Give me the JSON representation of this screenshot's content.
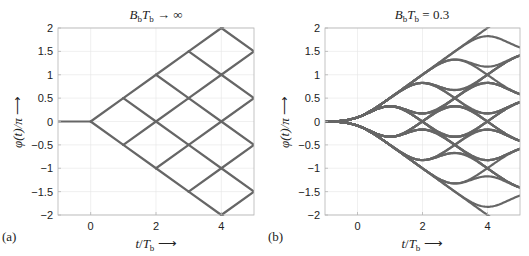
{
  "chart_data": [
    {
      "type": "line",
      "panel_label": "(a)",
      "title": "BbTb → ∞",
      "title_parts": {
        "B": "B",
        "b1": "b",
        "T": "T",
        "b2": "b",
        "rest": " → ∞"
      },
      "xlabel": "t/Tb ⟶",
      "ylabel": "φ(t)/π ⟶",
      "xlim": [
        -1,
        5
      ],
      "ylim": [
        -2,
        2
      ],
      "xticks": [
        0,
        2,
        4
      ],
      "yticks": [
        -2,
        -1.5,
        -1,
        -0.5,
        0,
        0.5,
        1,
        1.5,
        2
      ],
      "ytick_labels": [
        "−2",
        "−1.5",
        "−1",
        "−0.5",
        "0",
        "0.5",
        "1",
        "1.5",
        "2"
      ],
      "grid": true,
      "description": "Ideal MSK phase trellis: phase 0 for t<0, then changes by ±0.5 (in units of π) linearly per bit interval",
      "lines_start": {
        "x": [
          -1,
          0
        ],
        "y": [
          0,
          0
        ]
      },
      "trellis_step": 0.5,
      "bits": 5,
      "color": "#666666"
    },
    {
      "type": "line",
      "panel_label": "(b)",
      "title": "BbTb = 0.3",
      "title_parts": {
        "B": "B",
        "b1": "b",
        "T": "T",
        "b2": "b",
        "rest": " = 0.3"
      },
      "BT": 0.3,
      "xlabel": "t/Tb ⟶",
      "ylabel": "φ(t)/π ⟶",
      "xlim": [
        -1,
        5
      ],
      "ylim": [
        -2,
        2
      ],
      "xticks": [
        0,
        2,
        4
      ],
      "yticks": [
        -2,
        -1.5,
        -1,
        -0.5,
        0,
        0.5,
        1,
        1.5,
        2
      ],
      "ytick_labels": [
        "−2",
        "−1.5",
        "−1",
        "−0.5",
        "0",
        "0.5",
        "1",
        "1.5",
        "2"
      ],
      "grid": true,
      "description": "GMSK phase trellis with Gaussian pre-filter BbTb = 0.3: smoothed phase trajectories, outer bounds ±t/2",
      "bits": 5,
      "color": "#666666"
    }
  ],
  "axes": {
    "x_tick_labels": [
      "0",
      "2",
      "4"
    ],
    "xlabel_t": "t",
    "xlabel_T": "T",
    "xlabel_b": "b",
    "arrow": "⟶",
    "ylabel_phi": "φ(t)/π"
  },
  "labels": {
    "a": "(a)",
    "b": "(b)"
  }
}
